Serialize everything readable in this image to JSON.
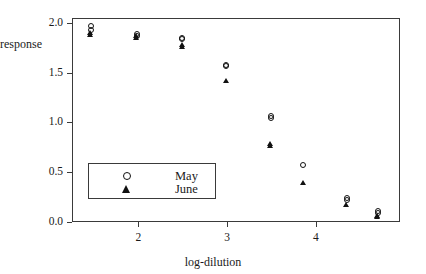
{
  "chart_data": {
    "type": "scatter",
    "title": "",
    "xlabel": "log-dilution",
    "ylabel": "response",
    "xlim": [
      1.25,
      4.95
    ],
    "ylim": [
      0.0,
      2.05
    ],
    "grid": false,
    "legend_position": "lower-left-inside",
    "xticks": [
      2,
      3,
      4
    ],
    "xticklabels": [
      "2",
      "3",
      "4"
    ],
    "yticks": [
      0.0,
      0.5,
      1.0,
      1.5,
      2.0
    ],
    "yticklabels": [
      "0.0",
      "0.5",
      "1.0",
      "1.5",
      "2.0"
    ],
    "series": [
      {
        "name": "May",
        "marker": "open-circle",
        "color": "#111111",
        "points": [
          {
            "x": 1.46,
            "y": 1.97
          },
          {
            "x": 1.46,
            "y": 1.93
          },
          {
            "x": 1.98,
            "y": 1.89
          },
          {
            "x": 1.98,
            "y": 1.87
          },
          {
            "x": 2.49,
            "y": 1.85
          },
          {
            "x": 2.49,
            "y": 1.84
          },
          {
            "x": 2.99,
            "y": 1.58
          },
          {
            "x": 2.99,
            "y": 1.57
          },
          {
            "x": 3.49,
            "y": 1.07
          },
          {
            "x": 3.49,
            "y": 1.05
          },
          {
            "x": 3.86,
            "y": 0.57
          },
          {
            "x": 4.35,
            "y": 0.24
          },
          {
            "x": 4.35,
            "y": 0.22
          },
          {
            "x": 4.7,
            "y": 0.11
          },
          {
            "x": 4.7,
            "y": 0.09
          }
        ]
      },
      {
        "name": "June",
        "marker": "filled-triangle",
        "color": "#111111",
        "points": [
          {
            "x": 1.46,
            "y": 1.9
          },
          {
            "x": 1.46,
            "y": 1.88
          },
          {
            "x": 1.98,
            "y": 1.87
          },
          {
            "x": 1.98,
            "y": 1.85
          },
          {
            "x": 2.49,
            "y": 1.78
          },
          {
            "x": 2.49,
            "y": 1.76
          },
          {
            "x": 2.99,
            "y": 1.42
          },
          {
            "x": 3.49,
            "y": 0.78
          },
          {
            "x": 3.49,
            "y": 0.76
          },
          {
            "x": 3.86,
            "y": 0.39
          },
          {
            "x": 4.35,
            "y": 0.17
          },
          {
            "x": 4.7,
            "y": 0.06
          },
          {
            "x": 4.7,
            "y": 0.05
          }
        ]
      }
    ],
    "legend": [
      {
        "label": "May",
        "marker": "open-circle"
      },
      {
        "label": "June",
        "marker": "filled-triangle"
      }
    ]
  }
}
